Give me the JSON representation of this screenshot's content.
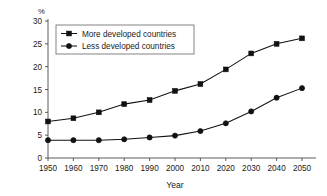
{
  "chart_data": {
    "type": "line",
    "title": "",
    "xlabel": "Year",
    "ylabel": "",
    "unit_label": "%",
    "grid": false,
    "legend_position": "upper-left-inside",
    "xlim": [
      1950,
      2050
    ],
    "ylim": [
      0,
      30
    ],
    "x": [
      1950,
      1960,
      1970,
      1980,
      1990,
      2000,
      2010,
      2020,
      2030,
      2040,
      2050
    ],
    "categories": [
      "1950",
      "1960",
      "1970",
      "1980",
      "1990",
      "2000",
      "2010",
      "2020",
      "2030",
      "2040",
      "2050"
    ],
    "xticks": [
      "1950",
      "1960",
      "1970",
      "1980",
      "1990",
      "2000",
      "2010",
      "2020",
      "2030",
      "2040",
      "2050"
    ],
    "yticks": [
      "0",
      "5",
      "10",
      "15",
      "20",
      "25",
      "30"
    ],
    "series": [
      {
        "name": "More developed countries",
        "marker": "square",
        "color": "#111111",
        "values": [
          8.0,
          8.7,
          10.0,
          11.8,
          12.7,
          14.7,
          16.2,
          19.4,
          22.9,
          25.0,
          26.2
        ]
      },
      {
        "name": "Less developed countries",
        "marker": "circle",
        "color": "#111111",
        "values": [
          3.9,
          3.9,
          3.9,
          4.1,
          4.5,
          4.9,
          5.9,
          7.6,
          10.2,
          13.2,
          15.3
        ]
      }
    ]
  },
  "legend": {
    "entries": [
      {
        "label": "More developed countries",
        "marker": "square"
      },
      {
        "label": "Less developed countries",
        "marker": "circle"
      }
    ]
  }
}
